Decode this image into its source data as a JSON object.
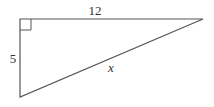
{
  "diagram": {
    "type": "right-triangle",
    "stroke_color": "#555555",
    "labels": {
      "top_side": "12",
      "left_side": "5",
      "hypotenuse": "x"
    },
    "right_angle_marker": true
  }
}
